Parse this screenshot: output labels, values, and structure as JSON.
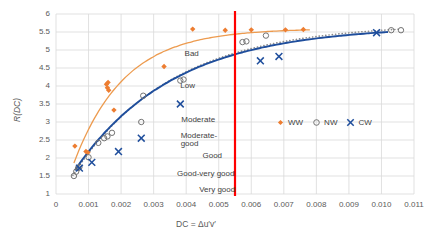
{
  "chart_data": {
    "type": "scatter",
    "title": "",
    "xlabel": "DC = Δu′v′",
    "ylabel": "R(DC)",
    "xlim": [
      0,
      0.011
    ],
    "ylim": [
      1,
      6
    ],
    "xticks": [
      "0",
      "0.001",
      "0.002",
      "0.003",
      "0.004",
      "0.005",
      "0.006",
      "0.007",
      "0.008",
      "0.009",
      "0.010",
      "0.011"
    ],
    "xtick_values": [
      0,
      0.001,
      0.002,
      0.003,
      0.004,
      0.005,
      0.006,
      0.007,
      0.008,
      0.009,
      0.01,
      0.011
    ],
    "yticks": [
      "1",
      "1.5",
      "2",
      "2.5",
      "3",
      "3.5",
      "4",
      "4.5",
      "5",
      "5.5",
      "6"
    ],
    "ytick_values": [
      1,
      1.5,
      2,
      2.5,
      3,
      3.5,
      4,
      4.5,
      5,
      5.5,
      6
    ],
    "grid": true,
    "legend_position": "center-right",
    "colors": {
      "WW": "#ED7D31",
      "NW": "#7F7F7F",
      "CW": "#1F4E9C",
      "threshold_line": "#FF0000",
      "grid": "#D9D9D9",
      "text": "#5A5A5A"
    },
    "series": [
      {
        "name": "WW",
        "marker": "diamond",
        "color": "#ED7D31",
        "points": [
          [
            0.00058,
            2.33
          ],
          [
            0.00092,
            2.18
          ],
          [
            0.00098,
            2.15
          ],
          [
            0.00155,
            4.05
          ],
          [
            0.00158,
            3.95
          ],
          [
            0.0016,
            4.1
          ],
          [
            0.00162,
            3.88
          ],
          [
            0.00178,
            3.33
          ],
          [
            0.00332,
            4.54
          ],
          [
            0.0042,
            5.58
          ],
          [
            0.0052,
            5.55
          ],
          [
            0.006,
            5.56
          ],
          [
            0.00705,
            5.56
          ],
          [
            0.0076,
            5.57
          ]
        ],
        "trend": "solid-curve"
      },
      {
        "name": "NW",
        "marker": "open-circle",
        "color": "#7F7F7F",
        "points": [
          [
            0.00055,
            1.5
          ],
          [
            0.00062,
            1.62
          ],
          [
            0.00068,
            1.72
          ],
          [
            0.00072,
            1.75
          ],
          [
            0.001,
            2.02
          ],
          [
            0.0013,
            2.42
          ],
          [
            0.00148,
            2.55
          ],
          [
            0.00158,
            2.6
          ],
          [
            0.00172,
            2.7
          ],
          [
            0.00262,
            3.0
          ],
          [
            0.00268,
            3.73
          ],
          [
            0.00382,
            4.15
          ],
          [
            0.00392,
            4.18
          ],
          [
            0.00573,
            5.22
          ],
          [
            0.00585,
            5.24
          ],
          [
            0.00645,
            5.4
          ],
          [
            0.0103,
            5.55
          ],
          [
            0.0106,
            5.55
          ]
        ],
        "trend": "dotted-curve"
      },
      {
        "name": "CW",
        "marker": "cross",
        "color": "#1F4E9C",
        "points": [
          [
            0.00072,
            1.72
          ],
          [
            0.0011,
            1.88
          ],
          [
            0.00192,
            2.18
          ],
          [
            0.00262,
            2.55
          ],
          [
            0.00382,
            3.5
          ],
          [
            0.00628,
            4.7
          ],
          [
            0.00685,
            4.82
          ],
          [
            0.00985,
            5.48
          ]
        ],
        "trend": "solid-curve"
      }
    ],
    "threshold": {
      "x": 0.0055,
      "orientation": "vertical",
      "color": "#FF0000"
    },
    "annotations": [
      {
        "text": "Bad",
        "x": 0.00395,
        "y": 4.88
      },
      {
        "text": "Low",
        "x": 0.00382,
        "y": 4.0
      },
      {
        "text": "Moderate",
        "x": 0.00385,
        "y": 3.05
      },
      {
        "text": "Moderate-",
        "x": 0.00383,
        "y": 2.62
      },
      {
        "text": "good",
        "x": 0.00383,
        "y": 2.38
      },
      {
        "text": "Good",
        "x": 0.0045,
        "y": 2.06
      },
      {
        "text": "Good-very good",
        "x": 0.00372,
        "y": 1.56
      },
      {
        "text": "Very good",
        "x": 0.0044,
        "y": 1.12
      }
    ],
    "legend": [
      {
        "label": "WW",
        "marker": "diamond",
        "color": "#ED7D31"
      },
      {
        "label": "NW",
        "marker": "open-circle",
        "color": "#7F7F7F"
      },
      {
        "label": "CW",
        "marker": "cross",
        "color": "#1F4E9C"
      }
    ]
  }
}
